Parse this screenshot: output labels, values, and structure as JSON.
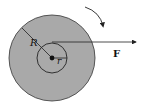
{
  "diagram": {
    "type": "wheel-axle-torque",
    "labels": {
      "outer_radius": "R",
      "inner_radius": "r",
      "force": "F"
    },
    "colors": {
      "outer_disk_fill": "#a9a9a9",
      "inner_disk_fill": "#a9a9a9",
      "stroke": "#222222",
      "background": "#ffffff"
    },
    "geometry": {
      "center": [
        52,
        58
      ],
      "outer_radius_px": 43,
      "inner_radius_px": 15,
      "force_line_y": 42,
      "force_line_end_x": 136
    },
    "rotation_arrow": "clockwise"
  }
}
